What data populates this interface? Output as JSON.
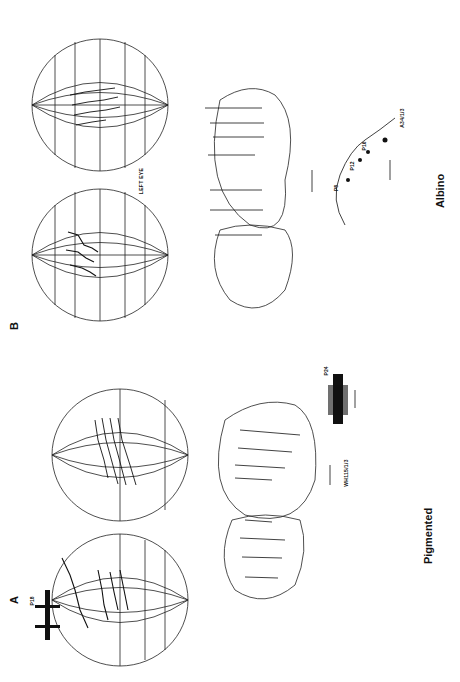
{
  "figure": {
    "orientation": "rotated 90 degrees counter-clockwise",
    "panels": [
      {
        "id": "A",
        "label": "A",
        "condition_label": "Pigmented",
        "specimen_label": "WH115/1/3",
        "recording_labels": [
          "P18",
          "P24"
        ],
        "content": "Two globe projections with mapped receptive-field tracks, a two-lobed map with horizontal electrode tracks, and two multi-unit recording traces with scale bars"
      },
      {
        "id": "B",
        "label": "B",
        "condition_label": "Albino",
        "specimen_label": "A34/1/3",
        "eye_label": "LEFT EYE",
        "recording_labels": [
          "P8",
          "P12",
          "P16"
        ],
        "content": "Two globe projections with mapped tracks, a two-lobed map with horizontal electrode tracks, and a curved penetration track with marked positions and a scale bar"
      }
    ]
  }
}
